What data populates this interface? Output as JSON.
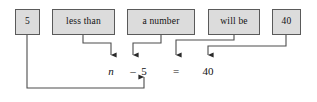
{
  "diagram": {
    "phrase_boxes": [
      {
        "name": "phrase-box-5",
        "label": "5",
        "x": 15,
        "y": 9,
        "w": 25,
        "h": 26
      },
      {
        "name": "phrase-box-less-than",
        "label": "less than",
        "x": 52,
        "y": 9,
        "w": 63,
        "h": 26
      },
      {
        "name": "phrase-box-a-number",
        "label": "a number",
        "x": 127,
        "y": 9,
        "w": 68,
        "h": 26
      },
      {
        "name": "phrase-box-will-be",
        "label": "will be",
        "x": 208,
        "y": 9,
        "w": 52,
        "h": 26
      },
      {
        "name": "phrase-box-40",
        "label": "40",
        "x": 272,
        "y": 9,
        "w": 29,
        "h": 26
      }
    ],
    "equation_tokens": [
      {
        "name": "equation-token-n",
        "text": "n",
        "x": 111,
        "y": 66,
        "italic": true
      },
      {
        "name": "equation-token-minus",
        "text": "–",
        "x": 133,
        "y": 66,
        "italic": false
      },
      {
        "name": "equation-token-5",
        "text": "5",
        "x": 144,
        "y": 66,
        "italic": false
      },
      {
        "name": "equation-token-equals",
        "text": "=",
        "x": 176,
        "y": 66,
        "italic": false
      },
      {
        "name": "equation-token-40",
        "text": "40",
        "x": 208,
        "y": 66,
        "italic": false
      }
    ],
    "equation_text": "n – 5 = 40",
    "colors": {
      "box_fill": "#dcdcdc",
      "box_border": "#5a5a5a",
      "connector_line": "#4d4d4d",
      "text": "#111111",
      "background": "#ffffff"
    },
    "connectors": [
      {
        "name": "connector-less-than-to-n",
        "from_box": "less than",
        "to_token": "n",
        "path": "M 83 35 L 83 43 L 111 43 L 111 56"
      },
      {
        "name": "connector-a-number-to-minus",
        "from_box": "a number",
        "to_token": "–",
        "path": "M 161 35 L 161 43 L 133 43 L 133 56"
      },
      {
        "name": "connector-will-be-to-equals",
        "from_box": "will be",
        "to_token": "=",
        "path": "M 234 35 L 234 40 L 176 40 L 176 56"
      },
      {
        "name": "connector-40-to-40",
        "from_box": "40",
        "to_token": "40",
        "path": "M 286 35 L 286 46 L 208 46 L 208 56"
      },
      {
        "name": "connector-5-to-5",
        "from_box": "5",
        "to_token": "5",
        "path": "M 27 35 L 27 88 L 144 88 L 144 75"
      }
    ]
  }
}
